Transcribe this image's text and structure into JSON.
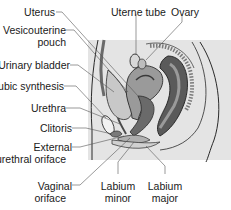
{
  "diagram": {
    "type": "anatomical-cross-section",
    "colors": {
      "background": "#ffffff",
      "panel": "#e4e4e4",
      "tissue_light": "#c8c8c8",
      "tissue_mid": "#9a9a9a",
      "tissue_dark": "#5a5a5a",
      "outline": "#2a2a2a",
      "leader": "#555555",
      "text": "#1a1a1a"
    },
    "labels": {
      "uterus": "Uterus",
      "uterine_tube": "Uterne tube",
      "ovary": "Ovary",
      "vesicouterine_line1": "Vesicouterine",
      "vesicouterine_line2": "pouch",
      "urinary_bladder": "Urinary bladder",
      "pubic_symphysis": "Pubic synthesis",
      "urethra": "Urethra",
      "clitoris": "Clitoris",
      "external_urethral_line1": "External",
      "external_urethral_line2": "urethral oriface",
      "vaginal_line1": "Vaginal",
      "vaginal_line2": "oriface",
      "labium_minor_line1": "Labium",
      "labium_minor_line2": "minor",
      "labium_major_line1": "Labium",
      "labium_major_line2": "major"
    }
  }
}
